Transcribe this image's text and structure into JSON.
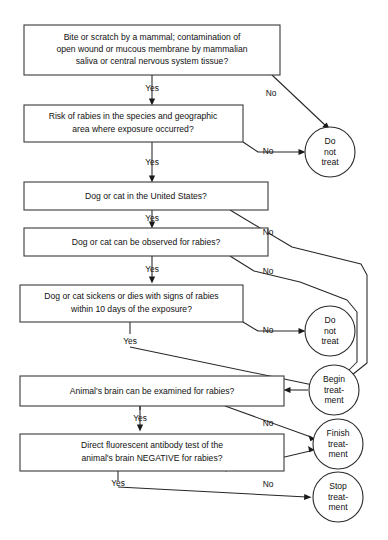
{
  "diagram": {
    "type": "flowchart",
    "orientation": "top-to-bottom",
    "background_color": "#ffffff",
    "line_color": "#262626",
    "text_color": "#111111"
  },
  "decisions": [
    {
      "id": "d1",
      "lines": [
        "Bite or scratch by a mammal; contamination of",
        "open wound or mucous membrane by mammalian",
        "saliva or central nervous system tissue?"
      ]
    },
    {
      "id": "d2",
      "lines": [
        "Risk of rabies in the species and geographic",
        "area where exposure occurred?"
      ]
    },
    {
      "id": "d3",
      "lines": [
        "Dog or cat in the United States?"
      ]
    },
    {
      "id": "d4",
      "lines": [
        "Dog or cat can be observed for rabies?"
      ]
    },
    {
      "id": "d5",
      "lines": [
        "Dog or cat sickens or dies with signs of rabies",
        "within 10 days of the exposure?"
      ]
    },
    {
      "id": "d6",
      "lines": [
        "Animal's brain can be examined for rabies?"
      ]
    },
    {
      "id": "d7",
      "lines": [
        "Direct fluorescent antibody test of the",
        "animal's brain NEGATIVE for rabies?"
      ]
    }
  ],
  "terminals": [
    {
      "id": "t1",
      "lines": [
        "Do",
        "not",
        "treat"
      ]
    },
    {
      "id": "t2",
      "lines": [
        "Do",
        "not",
        "treat"
      ]
    },
    {
      "id": "t3",
      "lines": [
        "Begin",
        "treat-",
        "ment"
      ]
    },
    {
      "id": "t4",
      "lines": [
        "Finish",
        "treat-",
        "ment"
      ]
    },
    {
      "id": "t5",
      "lines": [
        "Stop",
        "treat-",
        "ment"
      ]
    }
  ],
  "edge_labels": {
    "yes": "Yes",
    "no": "No"
  },
  "edges": [
    {
      "id": "e1",
      "from": "d1",
      "to": "d2",
      "label": "Yes"
    },
    {
      "id": "e2",
      "from": "d1",
      "to": "t1",
      "label": "No"
    },
    {
      "id": "e3",
      "from": "d2",
      "to": "d3",
      "label": "Yes"
    },
    {
      "id": "e4",
      "from": "d2",
      "to": "t1",
      "label": "No"
    },
    {
      "id": "e5",
      "from": "d3",
      "to": "d4",
      "label": "Yes"
    },
    {
      "id": "e6",
      "from": "d3",
      "to": "t3",
      "label": "No"
    },
    {
      "id": "e7",
      "from": "d4",
      "to": "d5",
      "label": "Yes"
    },
    {
      "id": "e8",
      "from": "d4",
      "to": "t3",
      "label": "No"
    },
    {
      "id": "e9",
      "from": "d5",
      "to": "t3",
      "label": "Yes"
    },
    {
      "id": "e10",
      "from": "d5",
      "to": "t2",
      "label": "No"
    },
    {
      "id": "e11",
      "from": "t3",
      "to": "d6",
      "label": ""
    },
    {
      "id": "e12",
      "from": "d6",
      "to": "d7",
      "label": "Yes"
    },
    {
      "id": "e13",
      "from": "d6",
      "to": "t4",
      "label": "No"
    },
    {
      "id": "e14",
      "from": "d7",
      "to": "t5",
      "label": "Yes"
    },
    {
      "id": "e15",
      "from": "d7",
      "to": "t4",
      "label": "No"
    }
  ]
}
